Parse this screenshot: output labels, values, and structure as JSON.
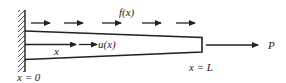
{
  "diagram": {
    "type": "tapered bar under axial load",
    "labels": {
      "distributed_load": "f(x)",
      "displacement": "u(x)",
      "position": "x",
      "left_end": "x = 0",
      "right_end": "x = L",
      "end_force": "P"
    },
    "colors": {
      "stroke": "#222222",
      "background": "#ffffff"
    },
    "distributed_load_arrow_count": 5
  }
}
